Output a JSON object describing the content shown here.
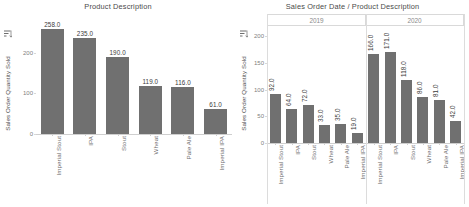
{
  "chart_data": [
    {
      "type": "bar",
      "title": "Product Description",
      "xlabel": "",
      "ylabel": "Sales Order Quantity Sold",
      "categories": [
        "Imperial Stout",
        "IPA",
        "Stout",
        "Wheat",
        "Pale Ale",
        "Imperial IPA"
      ],
      "values": [
        258.0,
        235.0,
        190.0,
        119.0,
        116.0,
        61.0
      ],
      "value_labels": [
        "258.0",
        "235.0",
        "190.0",
        "119.0",
        "116.0",
        "61.0"
      ],
      "yticks": [
        0,
        100,
        200
      ],
      "ytick_labels": [
        "0",
        "100",
        "200"
      ],
      "ylim": [
        0,
        275
      ],
      "grid": false,
      "legend": "none",
      "bar_color": "#707070"
    },
    {
      "type": "bar",
      "title": "Sales Order Date / Product Description",
      "xlabel": "",
      "ylabel": "Sales Order Quantity Sold",
      "groups": [
        "2019",
        "2020"
      ],
      "categories": [
        "Imperial Stout",
        "IPA",
        "Stout",
        "Wheat",
        "Pale Ale",
        "Imperial IPA"
      ],
      "series": [
        {
          "name": "2019",
          "values": [
            92.0,
            64.0,
            72.0,
            33.0,
            35.0,
            19.0
          ],
          "value_labels": [
            "92.0",
            "64.0",
            "72.0",
            "33.0",
            "35.0",
            "19.0"
          ]
        },
        {
          "name": "2020",
          "values": [
            166.0,
            171.0,
            118.0,
            86.0,
            81.0,
            42.0
          ],
          "value_labels": [
            "166.0",
            "171.0",
            "118.0",
            "86.0",
            "81.0",
            "42.0"
          ]
        }
      ],
      "yticks": [
        0,
        50,
        100,
        150,
        200
      ],
      "ytick_labels": [
        "0",
        "50",
        "100",
        "150",
        "200"
      ],
      "ylim": [
        0,
        215
      ],
      "grid": false,
      "legend": "none",
      "bar_color": "#707070"
    }
  ],
  "left_panel": {
    "title": "Product Description",
    "y_axis_label": "Sales Order Quantity Sold",
    "sort_icon": "sort-descending-icon"
  },
  "right_panel": {
    "title": "Sales Order Date / Product Description",
    "y_axis_label": "Sales Order Quantity Sold",
    "sort_icon": "sort-descending-icon"
  }
}
